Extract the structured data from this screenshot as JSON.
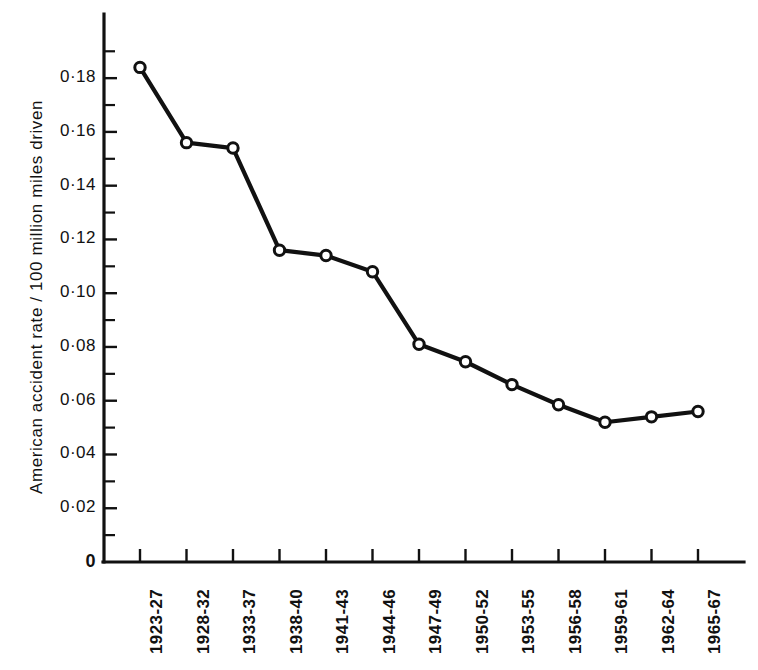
{
  "chart_data": {
    "type": "line",
    "title": "",
    "xlabel": "",
    "ylabel": "American accident rate  /  100 million miles driven",
    "categories": [
      "1923-27",
      "1928-32",
      "1933-37",
      "1938-40",
      "1941-43",
      "1944-46",
      "1947-49",
      "1950-52",
      "1953-55",
      "1956-58",
      "1959-61",
      "1962-64",
      "1965-67"
    ],
    "values": [
      0.184,
      0.156,
      0.154,
      0.116,
      0.114,
      0.108,
      0.081,
      0.0745,
      0.066,
      0.0585,
      0.052,
      0.054,
      0.056
    ],
    "ylim": [
      0,
      0.19
    ],
    "y_major_ticks": [
      0,
      0.02,
      0.04,
      0.06,
      0.08,
      0.1,
      0.12,
      0.14,
      0.16,
      0.18
    ],
    "y_major_tick_labels": [
      "0",
      "0·02",
      "0·04",
      "0·06",
      "0·08",
      "0·10",
      "0·12",
      "0·14",
      "0·16",
      "0·18"
    ],
    "y_minor_ticks": [
      0.01,
      0.03,
      0.05,
      0.07,
      0.09,
      0.11,
      0.13,
      0.15,
      0.17,
      0.19
    ],
    "grid": false,
    "legend": "none",
    "marker": "open-circle",
    "line_color": "#111111",
    "marker_fill": "#ffffff",
    "background_color": "#ffffff"
  }
}
